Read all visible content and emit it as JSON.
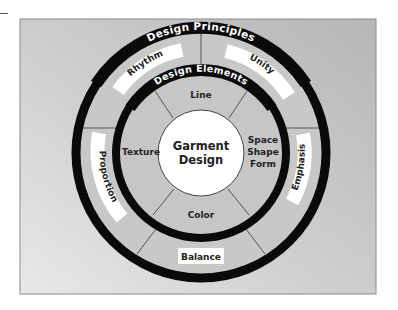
{
  "diagram": {
    "center": {
      "line1": "Garment",
      "line2": "Design"
    },
    "inner_ring": {
      "title": "Design Elements",
      "segments": [
        {
          "label": "Line"
        },
        {
          "label_lines": [
            "Space",
            "Shape",
            "Form"
          ]
        },
        {
          "label": "Color"
        },
        {
          "label": "Texture"
        }
      ]
    },
    "outer_ring": {
      "title": "Design Principles",
      "segments": [
        {
          "label": "Rhythm"
        },
        {
          "label": "Unity"
        },
        {
          "label": "Emphasis"
        },
        {
          "label": "Balance"
        },
        {
          "label": "Proportion"
        }
      ]
    },
    "colors": {
      "ring": "#0a0a0a",
      "center_fill": "#ffffff",
      "segment_fill": "#c9c9c9",
      "label_box": "#ffffff",
      "background_light": "#e6e6e6",
      "background_dark": "#b9b9b9"
    }
  }
}
